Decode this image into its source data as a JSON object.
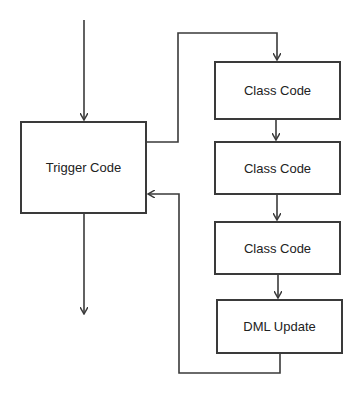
{
  "diagram": {
    "title": "",
    "colors": {
      "stroke": "#3a3a3a",
      "text": "#222222",
      "background": "#ffffff"
    },
    "nodes": [
      {
        "id": "trigger",
        "label": "Trigger Code"
      },
      {
        "id": "class1",
        "label": "Class Code"
      },
      {
        "id": "class2",
        "label": "Class Code"
      },
      {
        "id": "class3",
        "label": "Class Code"
      },
      {
        "id": "dml",
        "label": "DML Update"
      }
    ],
    "edges": [
      {
        "from": "entry",
        "to": "trigger"
      },
      {
        "from": "trigger",
        "to": "class1"
      },
      {
        "from": "class1",
        "to": "class2"
      },
      {
        "from": "class2",
        "to": "class3"
      },
      {
        "from": "class3",
        "to": "dml"
      },
      {
        "from": "dml",
        "to": "trigger"
      },
      {
        "from": "trigger",
        "to": "exit"
      }
    ]
  }
}
